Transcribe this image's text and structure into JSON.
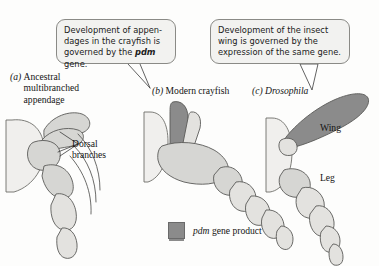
{
  "figure": {
    "background": "#fdfdfc",
    "colors": {
      "pdm_dark_gray": "#8b8b8b",
      "limb_light_gray": "#d4d4d2",
      "body_pale": "#efeeec",
      "outline": "#5a5a58",
      "callout_fill": "#f2f2f0",
      "callout_border": "#8a8a86",
      "text": "#141414"
    }
  },
  "callouts": [
    {
      "id": "callout-crayfish",
      "line1": "Development of appen-",
      "line2": "dages in the crayfish is",
      "line3_pre": "governed by the ",
      "line3_gene": "pdm",
      "line3_post": " gene.",
      "full_text": "Development of appendages in the crayfish is governed by the pdm gene."
    },
    {
      "id": "callout-insect-wing",
      "line1": "Development of the insect",
      "line2": "wing is governed by the",
      "line3": "expression of the same gene.",
      "full_text": "Development of the insect wing is governed by the expression of the same gene."
    }
  ],
  "panels": [
    {
      "tag": "(a)",
      "label_line1": "Ancestral",
      "label_line2": "multibranched",
      "label_line3": "appendage",
      "label": "Ancestral multibranched appendage"
    },
    {
      "tag": "(b)",
      "label": "Modern crayfish"
    },
    {
      "tag": "(c)",
      "label": "Drosophila",
      "italic": true
    }
  ],
  "annotations": {
    "dorsal_line1": "Dorsal",
    "dorsal_line2": "branches",
    "wing": "Wing",
    "leg": "Leg"
  },
  "legend": {
    "swatch_color": "#8b8b8b",
    "gene": "pdm",
    "label_rest": " gene product",
    "full_text": "pdm gene product"
  }
}
